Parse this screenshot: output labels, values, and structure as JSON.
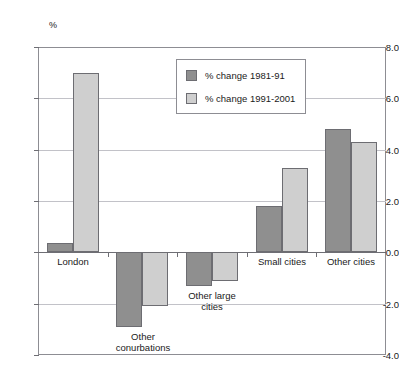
{
  "artifact_text": "",
  "chart_data": {
    "type": "bar",
    "title": "",
    "xlabel": "",
    "ylabel": "%",
    "unit_label": "%",
    "ylim": [
      -4.0,
      8.0
    ],
    "ytick_step": 2.0,
    "grid": true,
    "legend_position": "inside-top-center",
    "categories": [
      "London",
      "Other\nconurbations",
      "Other large\ncities",
      "Small cities",
      "Other cities"
    ],
    "ytick_labels": [
      "8.0",
      "6.0",
      "4.0",
      "2.0",
      "0.0",
      "-2.0",
      "-4.0"
    ],
    "ytick_values": [
      8.0,
      6.0,
      4.0,
      2.0,
      0.0,
      -2.0,
      -4.0
    ],
    "series": [
      {
        "name": "% change 1981-91",
        "color": "#8f8f8f",
        "values": [
          0.35,
          -2.9,
          -1.3,
          1.8,
          4.8
        ]
      },
      {
        "name": "% change 1991-2001",
        "color": "#cfcfcf",
        "values": [
          7.0,
          -2.1,
          -1.1,
          3.3,
          4.3
        ]
      }
    ]
  }
}
